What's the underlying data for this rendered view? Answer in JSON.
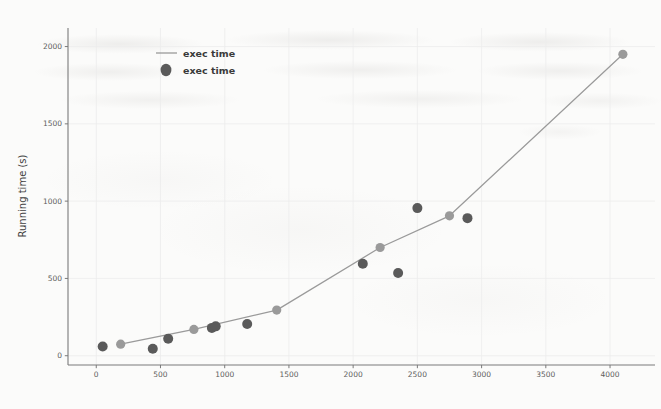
{
  "chart_data": {
    "type": "line",
    "title": "",
    "xlabel": "",
    "ylabel": "Running time (s)",
    "xlim": [
      -220,
      4350
    ],
    "ylim": [
      -60,
      2120
    ],
    "xticks": [
      0,
      500,
      1000,
      1500,
      2000,
      2500,
      3000,
      3500,
      4000
    ],
    "xtick_labels": [
      "0",
      "500",
      "1000",
      "1500",
      "2000",
      "2500",
      "3000",
      "3500",
      "4000"
    ],
    "yticks": [
      0,
      500,
      1000,
      1500,
      2000
    ],
    "ytick_labels": [
      "0",
      "500",
      "1000",
      "1500",
      "2000"
    ],
    "grid": true,
    "legend_position": "upper left",
    "series": [
      {
        "name": "exec time",
        "kind": "line",
        "color": "#9a9a9a",
        "marker_color": "#9a9a9a",
        "x": [
          190,
          760,
          1405,
          2210,
          2750,
          4100
        ],
        "y": [
          75,
          170,
          295,
          700,
          905,
          1950
        ]
      },
      {
        "name": "exec time",
        "kind": "scatter",
        "color": "#5a5a5a",
        "x": [
          50,
          440,
          560,
          900,
          930,
          1175,
          2075,
          2350,
          2500,
          2890
        ],
        "y": [
          60,
          45,
          110,
          180,
          190,
          205,
          595,
          535,
          955,
          890
        ]
      }
    ]
  },
  "legend": {
    "entries": [
      {
        "label": "exec time",
        "marker": "line",
        "color": "#9a9a9a"
      },
      {
        "label": "exec time",
        "marker": "circle",
        "color": "#5a5a5a"
      }
    ]
  },
  "colors": {
    "background": "#fbfbfa",
    "axis": "#7a7a7a",
    "grid": "#ececec",
    "line": "#9a9a9a",
    "scatter": "#5a5a5a",
    "text": "#3f3f3f"
  }
}
